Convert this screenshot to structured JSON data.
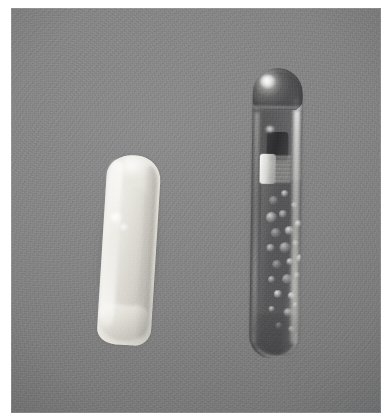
{
  "image": {
    "type": "photograph",
    "medium": "grayscale photographic plate",
    "background_color": "#838383",
    "page_color": "#ffffff",
    "plate": {
      "left": 11,
      "top": 8,
      "width": 370,
      "height": 405
    },
    "caption": "",
    "title": ""
  },
  "objects": [
    {
      "id": "crystal",
      "name": "translucent crystal specimen",
      "description": "Pale whitish elongated translucent crystal with blunt rounded top and angled flat base, tilted slightly clockwise",
      "position": {
        "left": 80,
        "top": 139,
        "width": 72,
        "height": 206
      },
      "rotation_deg": 3.5,
      "colors": {
        "body_light": "#eceae3",
        "body_mid": "#dedbd3",
        "body_dark": "#b1aea6",
        "highlight": "#ffffff"
      },
      "features": [
        "left-edge highlight ridge",
        "top specular patch",
        "two bright surface specks",
        "angled basal termination"
      ]
    },
    {
      "id": "vial",
      "name": "sealed glass ampoule",
      "description": "Cylindrical sealed glass vial with rounded dome top and rounded base, containing a dark metallic slug with a bright banded section and granular bubbles below",
      "position": {
        "left": 231,
        "top": 60,
        "width": 70,
        "height": 296
      },
      "rotation_deg": 0.8,
      "colors": {
        "glass_mid": "#52525a",
        "glass_light": "#c4c4c2",
        "slug_dark": "#2c2c2e",
        "specular": "#ffffff"
      },
      "features": [
        "domed sealed tip with specular highlight",
        "dark metallic slug",
        "bright banded metal section",
        "granular bubble field",
        "vertical specular streak on right wall",
        "rounded base"
      ]
    }
  ],
  "bubbles": [
    {
      "left": 8,
      "top": 16,
      "size": 9
    },
    {
      "left": 20,
      "top": 10,
      "size": 7
    },
    {
      "left": 5,
      "top": 32,
      "size": 11
    },
    {
      "left": 18,
      "top": 30,
      "size": 8
    },
    {
      "left": 30,
      "top": 22,
      "size": 6
    },
    {
      "left": 10,
      "top": 48,
      "size": 10
    },
    {
      "left": 24,
      "top": 46,
      "size": 9
    },
    {
      "left": 34,
      "top": 40,
      "size": 7
    },
    {
      "left": 6,
      "top": 64,
      "size": 8
    },
    {
      "left": 19,
      "top": 62,
      "size": 11
    },
    {
      "left": 32,
      "top": 60,
      "size": 6
    },
    {
      "left": 12,
      "top": 80,
      "size": 9
    },
    {
      "left": 26,
      "top": 78,
      "size": 7
    },
    {
      "left": 36,
      "top": 74,
      "size": 8
    },
    {
      "left": 8,
      "top": 96,
      "size": 7
    },
    {
      "left": 22,
      "top": 94,
      "size": 10
    },
    {
      "left": 34,
      "top": 92,
      "size": 6
    },
    {
      "left": 14,
      "top": 110,
      "size": 8
    },
    {
      "left": 28,
      "top": 112,
      "size": 7
    },
    {
      "left": 9,
      "top": 126,
      "size": 6
    },
    {
      "left": 24,
      "top": 128,
      "size": 9
    },
    {
      "left": 33,
      "top": 122,
      "size": 5
    },
    {
      "left": 16,
      "top": 142,
      "size": 7
    },
    {
      "left": 29,
      "top": 146,
      "size": 6
    }
  ]
}
